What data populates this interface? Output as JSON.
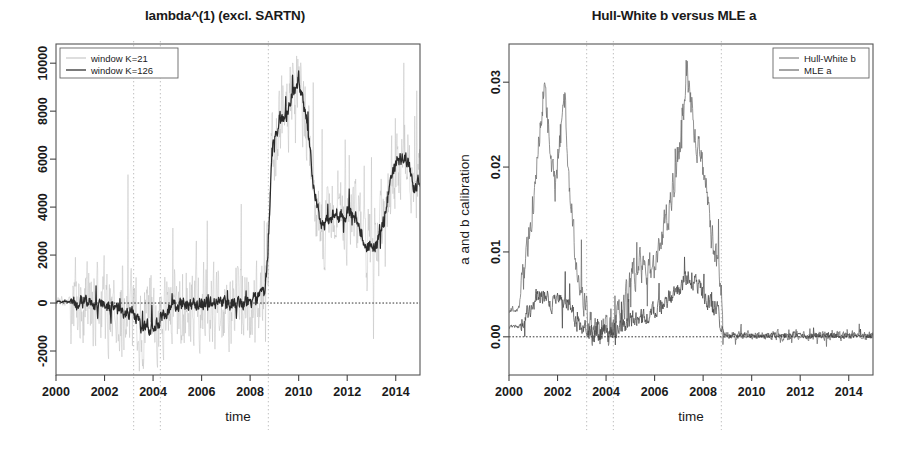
{
  "figure": {
    "width": 899,
    "height": 454,
    "background": "#ffffff",
    "panels": 2
  },
  "chart_data": [
    {
      "id": "left",
      "type": "line",
      "title": "lambda^(1) (excl. SARTN)",
      "xlabel": "time",
      "ylabel": "",
      "xlim": [
        2000,
        2015
      ],
      "ylim": [
        -3000,
        10800
      ],
      "xticks": [
        2000,
        2002,
        2004,
        2006,
        2008,
        2010,
        2012,
        2014
      ],
      "xticklabels": [
        "2000",
        "2002",
        "2004",
        "2006",
        "2008",
        "2010",
        "2012",
        "2014"
      ],
      "yticks": [
        -2000,
        0,
        2000,
        4000,
        6000,
        8000,
        10000
      ],
      "yticklabels": [
        "-2000",
        "0",
        "2000",
        "4000",
        "6000",
        "8000",
        "10000"
      ],
      "grid": true,
      "gridlines_x": [
        2003.2,
        2004.3,
        2008.75
      ],
      "hline": 0,
      "legend_position": "top-left",
      "series": [
        {
          "name": "window K=21",
          "color": "#bdbdbd",
          "width": 0.55,
          "seed": 17,
          "noise": 1450,
          "x": [
            2000.4,
            2000.8,
            2001.2,
            2001.6,
            2002.0,
            2002.4,
            2002.8,
            2003.1,
            2003.25,
            2003.5,
            2003.8,
            2004.0,
            2004.2,
            2004.35,
            2004.6,
            2005.0,
            2005.4,
            2005.8,
            2006.2,
            2006.6,
            2007.0,
            2007.4,
            2007.8,
            2008.2,
            2008.6,
            2008.75,
            2008.9,
            2009.2,
            2009.5,
            2009.8,
            2010.0,
            2010.2,
            2010.4,
            2010.6,
            2010.9,
            2011.2,
            2011.5,
            2011.8,
            2012.1,
            2012.4,
            2012.7,
            2013.0,
            2013.3,
            2013.6,
            2013.9,
            2014.2,
            2014.5,
            2014.7
          ],
          "values": [
            60,
            20,
            -40,
            -80,
            -120,
            -200,
            -300,
            -350,
            -500,
            -900,
            -1000,
            -950,
            -850,
            -500,
            -250,
            -150,
            -120,
            -100,
            -80,
            -60,
            -40,
            -20,
            30,
            120,
            400,
            2300,
            6500,
            7600,
            7900,
            8900,
            9400,
            8200,
            7000,
            5200,
            3300,
            3400,
            3900,
            3500,
            3800,
            3500,
            2600,
            2200,
            2600,
            4000,
            5600,
            6100,
            6000,
            5000
          ]
        },
        {
          "name": "window K=126",
          "color": "#2a2a2a",
          "width": 1.25,
          "seed": 91,
          "noise": 260,
          "x": [
            2000.4,
            2000.8,
            2001.2,
            2001.6,
            2002.0,
            2002.4,
            2002.8,
            2003.1,
            2003.25,
            2003.5,
            2003.8,
            2004.0,
            2004.2,
            2004.35,
            2004.6,
            2005.0,
            2005.4,
            2005.8,
            2006.2,
            2006.6,
            2007.0,
            2007.4,
            2007.8,
            2008.2,
            2008.6,
            2008.75,
            2008.9,
            2009.2,
            2009.5,
            2009.8,
            2010.0,
            2010.2,
            2010.4,
            2010.6,
            2010.9,
            2011.2,
            2011.5,
            2011.8,
            2012.1,
            2012.4,
            2012.7,
            2013.0,
            2013.3,
            2013.6,
            2013.9,
            2014.2,
            2014.5,
            2014.7
          ],
          "values": [
            60,
            20,
            -40,
            -80,
            -120,
            -200,
            -300,
            -350,
            -500,
            -900,
            -1000,
            -950,
            -850,
            -500,
            -250,
            -150,
            -120,
            -100,
            -80,
            -60,
            -40,
            -20,
            30,
            120,
            400,
            2300,
            6500,
            7600,
            7900,
            8900,
            9400,
            8200,
            7000,
            5200,
            3300,
            3400,
            3900,
            3500,
            3800,
            3500,
            2600,
            2200,
            2600,
            4000,
            5600,
            6100,
            6000,
            5000
          ]
        }
      ]
    },
    {
      "id": "right",
      "type": "line",
      "title": "Hull-White b versus MLE a",
      "xlabel": "time",
      "ylabel": "a and b calibration",
      "xlim": [
        2000,
        2015
      ],
      "ylim": [
        -0.0045,
        0.0345
      ],
      "xticks": [
        2000,
        2002,
        2004,
        2006,
        2008,
        2010,
        2012,
        2014
      ],
      "xticklabels": [
        "2000",
        "2002",
        "2004",
        "2006",
        "2008",
        "2010",
        "2012",
        "2014"
      ],
      "yticks": [
        0.0,
        0.01,
        0.02,
        0.03
      ],
      "yticklabels": [
        "0.00",
        "0.01",
        "0.02",
        "0.03"
      ],
      "grid": true,
      "gridlines_x": [
        2003.2,
        2004.3,
        2008.75
      ],
      "hline": 0,
      "legend_position": "top-right",
      "series": [
        {
          "name": "Hull-White b",
          "color": "#6d6d6d",
          "width": 0.75,
          "seed": 33,
          "noise": 0.0016,
          "x": [
            2000.4,
            2000.7,
            2001.0,
            2001.2,
            2001.45,
            2001.6,
            2001.75,
            2001.9,
            2002.1,
            2002.3,
            2002.5,
            2002.7,
            2002.9,
            2003.1,
            2003.3,
            2003.6,
            2003.9,
            2004.1,
            2004.3,
            2004.5,
            2004.8,
            2005.1,
            2005.4,
            2005.7,
            2006.0,
            2006.3,
            2006.6,
            2006.9,
            2007.15,
            2007.35,
            2007.5,
            2007.7,
            2007.9,
            2008.1,
            2008.35,
            2008.6,
            2008.75,
            2008.85,
            2009.2,
            2009.7,
            2010.2,
            2010.8,
            2011.4,
            2012.0,
            2012.6,
            2013.2,
            2013.8,
            2014.3,
            2014.7
          ],
          "values": [
            0.0033,
            0.0085,
            0.0155,
            0.0215,
            0.0295,
            0.0255,
            0.0205,
            0.0175,
            0.0235,
            0.0285,
            0.0175,
            0.0105,
            0.0065,
            0.004,
            0.0015,
            0.0006,
            0.0004,
            0.0005,
            0.0006,
            0.0018,
            0.004,
            0.0075,
            0.0082,
            0.0078,
            0.0085,
            0.0115,
            0.015,
            0.0195,
            0.0255,
            0.0315,
            0.027,
            0.0225,
            0.0215,
            0.0175,
            0.012,
            0.0085,
            0.006,
            0.0002,
            0.0001,
            0.0002,
            0.0001,
            0.0002,
            0.0001,
            0.0002,
            0.0001,
            0.0002,
            0.0001,
            0.0002,
            0.0001
          ]
        },
        {
          "name": "MLE a",
          "color": "#4a4a4a",
          "width": 0.75,
          "seed": 58,
          "noise": 0.0009,
          "x": [
            2000.4,
            2000.7,
            2001.0,
            2001.3,
            2001.6,
            2001.9,
            2002.2,
            2002.5,
            2002.8,
            2003.1,
            2003.4,
            2003.8,
            2004.1,
            2004.4,
            2004.7,
            2005.0,
            2005.3,
            2005.6,
            2005.9,
            2006.2,
            2006.5,
            2006.8,
            2007.1,
            2007.4,
            2007.7,
            2008.0,
            2008.3,
            2008.6,
            2008.8,
            2009.0,
            2009.5,
            2010.0,
            2010.6,
            2011.2,
            2011.8,
            2012.4,
            2013.0,
            2013.6,
            2014.2,
            2014.7
          ],
          "values": [
            0.0012,
            0.0022,
            0.004,
            0.005,
            0.0046,
            0.0038,
            0.0042,
            0.0035,
            0.002,
            0.001,
            0.0004,
            0.0003,
            0.0004,
            0.0006,
            0.0012,
            0.0018,
            0.0022,
            0.0026,
            0.003,
            0.0036,
            0.0042,
            0.005,
            0.006,
            0.007,
            0.0062,
            0.005,
            0.0038,
            0.003,
            0.0002,
            0.0001,
            0.0002,
            0.0001,
            0.0002,
            0.0001,
            0.0002,
            0.0001,
            0.0002,
            0.0001,
            0.0002,
            0.0001
          ]
        }
      ]
    }
  ]
}
